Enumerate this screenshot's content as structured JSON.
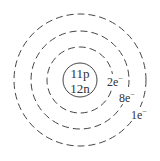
{
  "diagram": {
    "type": "bohr-model",
    "nucleus": {
      "protons": "11p",
      "neutrons": "12n"
    },
    "shells": [
      {
        "electrons": "2e",
        "charge": "−"
      },
      {
        "electrons": "8e",
        "charge": "−"
      },
      {
        "electrons": "1e",
        "charge": "−"
      }
    ],
    "colors": {
      "stroke": "#444444",
      "text": "#333333"
    }
  }
}
